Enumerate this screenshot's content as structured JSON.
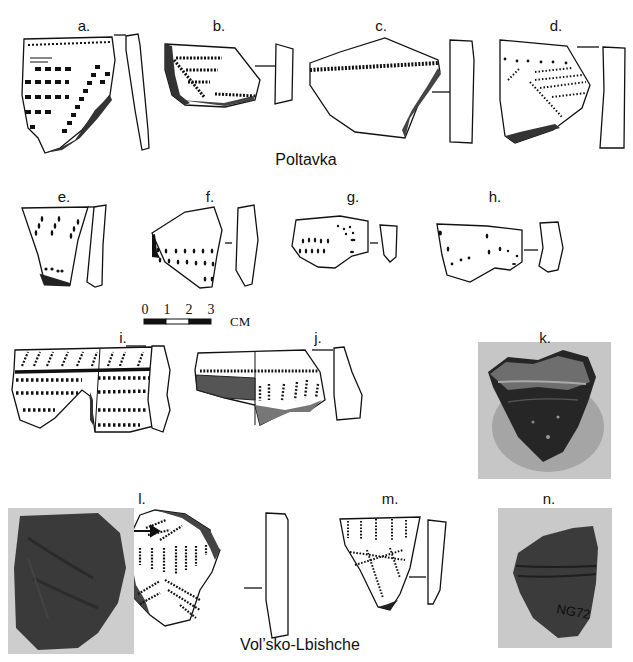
{
  "figure": {
    "groups": [
      {
        "name": "Poltavka",
        "items": [
          "a.",
          "b.",
          "c.",
          "d.",
          "e.",
          "f.",
          "g.",
          "h.",
          "i.",
          "j.",
          "k."
        ]
      },
      {
        "name": "Vol'sko-Lbishche",
        "items": [
          "l.",
          "m.",
          "n."
        ]
      }
    ],
    "group_labels": {
      "poltavka": "Poltavka",
      "volsko": "Vol’sko-Lbishche"
    },
    "labels": {
      "a": "a.",
      "b": "b.",
      "c": "c.",
      "d": "d.",
      "e": "e.",
      "f": "f.",
      "g": "g.",
      "h": "h.",
      "i": "i.",
      "j": "j.",
      "k": "k.",
      "l": "l.",
      "m": "m.",
      "n": "n."
    },
    "scale_bar": {
      "ticks": [
        "0",
        "1",
        "2",
        "3"
      ],
      "unit": "CM"
    },
    "photo_inscription": "NG72",
    "colors": {
      "ink": "#111111",
      "photo_bg": "#c8c8c8",
      "sherd_dark": "#2a2a2a"
    }
  }
}
